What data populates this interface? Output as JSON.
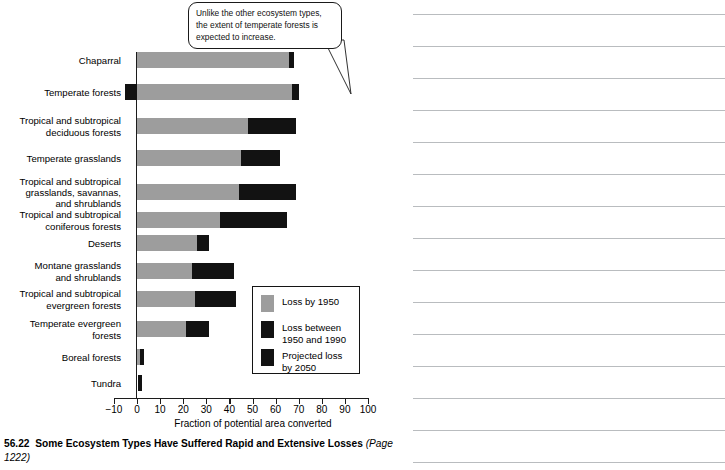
{
  "callout": {
    "text": "Unlike the other ecosystem types, the extent of temperate forests is expected to increase."
  },
  "legend": {
    "items": [
      {
        "label": "Loss by 1950",
        "color": "#9d9d9d"
      },
      {
        "label": "Loss between\n1950 and 1990",
        "color": "#121212"
      },
      {
        "label": "Projected loss\nby 2050",
        "color": "#121212"
      }
    ]
  },
  "caption": {
    "number": "56.22",
    "title": "Some Ecosystem Types Have Suffered Rapid and Extensive Losses",
    "source": "(Page 1222)"
  },
  "chart_data": {
    "type": "bar",
    "orientation": "horizontal",
    "stacked": true,
    "title": "Some Ecosystem Types Have Suffered Rapid and Extensive Losses",
    "xlabel": "Fraction of potential area converted",
    "ylabel": "",
    "xlim": [
      -10,
      100
    ],
    "xticks": [
      -10,
      0,
      10,
      20,
      30,
      40,
      50,
      60,
      70,
      80,
      90,
      100
    ],
    "xticklabels": [
      "−10",
      "0",
      "10",
      "20",
      "30",
      "40",
      "50",
      "60",
      "70",
      "80",
      "90",
      "100"
    ],
    "grid": false,
    "legend_position": "center-right-inside",
    "categories": [
      "Chaparral",
      "Temperate forests",
      "Tropical and subtropical\ndeciduous forests",
      "Temperate grasslands",
      "Tropical and subtropical\ngrasslands, savannas,\nand shrublands",
      "Tropical and subtropical\nconiferous forests",
      "Deserts",
      "Montane grasslands\nand shrublands",
      "Tropical and subtropical\nevergreen forests",
      "Temperate evergreen\nforests",
      "Boreal forests",
      "Tundra"
    ],
    "series": [
      {
        "name": "Loss by 1950",
        "color": "#9d9d9d",
        "values": [
          66,
          67,
          48,
          45,
          44,
          36,
          26,
          24,
          25,
          21,
          1.5,
          0
        ]
      },
      {
        "name": "Loss between 1950 and 1990",
        "color": "#121212",
        "values": [
          2,
          3,
          21,
          17,
          25,
          29,
          5,
          18,
          18,
          10,
          1.5,
          1.5
        ]
      },
      {
        "name": "Projected loss by 2050",
        "color": "#121212",
        "values": [
          0,
          -5,
          0,
          0,
          0,
          0,
          0,
          0,
          0,
          0,
          0,
          0
        ]
      }
    ],
    "bars": [
      {
        "category": "Chaparral",
        "segments": [
          {
            "from": 0,
            "to": 66,
            "color": "#9d9d9d"
          },
          {
            "from": 66,
            "to": 68,
            "color": "#121212"
          }
        ]
      },
      {
        "category": "Temperate forests",
        "segments": [
          {
            "from": -5,
            "to": 0,
            "color": "#121212"
          },
          {
            "from": 0,
            "to": 67,
            "color": "#9d9d9d"
          },
          {
            "from": 67,
            "to": 70,
            "color": "#121212"
          }
        ]
      },
      {
        "category": "Tropical and subtropical\ndeciduous forests",
        "segments": [
          {
            "from": 0,
            "to": 48,
            "color": "#9d9d9d"
          },
          {
            "from": 48,
            "to": 69,
            "color": "#121212"
          }
        ]
      },
      {
        "category": "Temperate grasslands",
        "segments": [
          {
            "from": 0,
            "to": 45,
            "color": "#9d9d9d"
          },
          {
            "from": 45,
            "to": 62,
            "color": "#121212"
          }
        ]
      },
      {
        "category": "Tropical and subtropical\ngrasslands, savannas,\nand shrublands",
        "segments": [
          {
            "from": 0,
            "to": 44,
            "color": "#9d9d9d"
          },
          {
            "from": 44,
            "to": 69,
            "color": "#121212"
          }
        ]
      },
      {
        "category": "Tropical and subtropical\nconiferous forests",
        "segments": [
          {
            "from": 0,
            "to": 36,
            "color": "#9d9d9d"
          },
          {
            "from": 36,
            "to": 65,
            "color": "#121212"
          }
        ]
      },
      {
        "category": "Deserts",
        "segments": [
          {
            "from": 0,
            "to": 26,
            "color": "#9d9d9d"
          },
          {
            "from": 26,
            "to": 31,
            "color": "#121212"
          }
        ]
      },
      {
        "category": "Montane grasslands\nand shrublands",
        "segments": [
          {
            "from": 0,
            "to": 24,
            "color": "#9d9d9d"
          },
          {
            "from": 24,
            "to": 42,
            "color": "#121212"
          }
        ]
      },
      {
        "category": "Tropical and subtropical\nevergreen forests",
        "segments": [
          {
            "from": 0,
            "to": 25,
            "color": "#9d9d9d"
          },
          {
            "from": 25,
            "to": 43,
            "color": "#121212"
          }
        ]
      },
      {
        "category": "Temperate evergreen\nforests",
        "segments": [
          {
            "from": 0,
            "to": 21,
            "color": "#9d9d9d"
          },
          {
            "from": 21,
            "to": 31,
            "color": "#121212"
          }
        ]
      },
      {
        "category": "Boreal forests",
        "segments": [
          {
            "from": 0,
            "to": 1.5,
            "color": "#9d9d9d"
          },
          {
            "from": 1.5,
            "to": 3,
            "color": "#121212"
          }
        ]
      },
      {
        "category": "Tundra",
        "segments": [
          {
            "from": 0.5,
            "to": 2,
            "color": "#121212"
          }
        ]
      }
    ],
    "row_y": [
      60,
      92,
      126,
      158,
      192,
      220,
      243,
      271,
      299,
      329,
      357,
      383
    ]
  },
  "ruled_lines": {
    "count": 15,
    "color": "#b9bcbf",
    "y": [
      14,
      46,
      78,
      110,
      142,
      174,
      206,
      238,
      270,
      302,
      334,
      366,
      398,
      430,
      462
    ]
  }
}
